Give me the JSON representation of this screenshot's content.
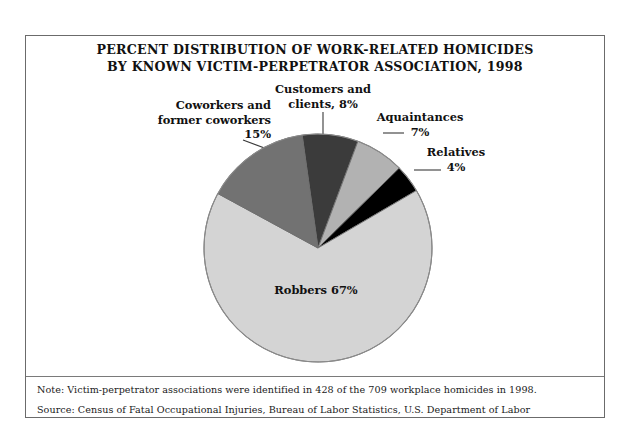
{
  "figure": {
    "title_line1": "PERCENT DISTRIBUTION OF WORK-RELATED HOMICIDES",
    "title_line2": "BY KNOWN VICTIM-PERPETRATOR ASSOCIATION, 1998",
    "note": "Note: Victim-perpetrator associations were identified in 428 of the 709 workplace homicides in 1998.",
    "source": "Source: Census of Fatal Occupational Injuries,  Bureau of Labor Statistics, U.S. Department of Labor"
  },
  "labels": {
    "coworkers_l1": "Coworkers and",
    "coworkers_l2": "former coworkers",
    "coworkers_l3": "15%",
    "customers_l1": "Customers and",
    "customers_l2": "clients, 8%",
    "acquaintances_l1": "Aquaintances",
    "acquaintances_l2": "7%",
    "relatives_l1": "Relatives",
    "relatives_l2": "4%",
    "robbers": "Robbers 67%"
  },
  "chart_data": {
    "type": "pie",
    "title": "PERCENT DISTRIBUTION OF WORK-RELATED HOMICIDES BY KNOWN VICTIM-PERPETRATOR ASSOCIATION, 1998",
    "xlabel": "",
    "ylabel": "",
    "unit": "percent",
    "start_angle_deg": -8,
    "direction": "clockwise",
    "legend_position": "none (direct labels with leader lines)",
    "grid": false,
    "categories": [
      "Customers and clients",
      "Aquaintances",
      "Relatives",
      "Robbers",
      "Coworkers and former coworkers"
    ],
    "values": [
      8,
      7,
      4,
      67,
      15
    ],
    "colors": [
      "#3b3b3b",
      "#b2b2b2",
      "#000000",
      "#d4d4d4",
      "#727272"
    ],
    "slice_labels": [
      "Customers and clients, 8%",
      "Aquaintances 7%",
      "Relatives 4%",
      "Robbers 67%",
      "Coworkers and former coworkers 15%"
    ],
    "annotations": [
      "Note: Victim-perpetrator associations were identified in 428 of the 709 workplace homicides in 1998.",
      "Source: Census of Fatal Occupational Injuries,  Bureau of Labor Statistics, U.S. Department of Labor"
    ]
  }
}
